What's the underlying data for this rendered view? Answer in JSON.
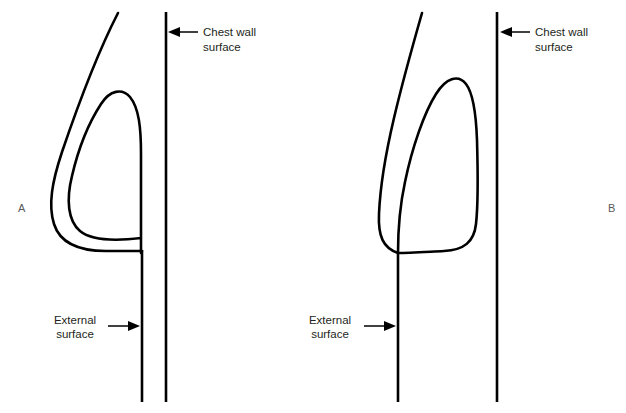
{
  "figure": {
    "background_color": "#ffffff",
    "stroke_color": "#000000",
    "text_color": "#231f20",
    "panel_letter_color": "#5a5a5a"
  },
  "panels": [
    {
      "letter": "A",
      "letter_x": 18,
      "letter_y": 212,
      "chest_wall": {
        "label_line_1": "Chest wall",
        "label_line_2": "surface",
        "label_x": 203,
        "label_y_1": 32,
        "label_y_2": 47,
        "arrow_direction": "left",
        "arrow_tip_x": 170,
        "arrow_tail_x": 198,
        "arrow_y": 32,
        "line_x": 166,
        "line_top_y": 12,
        "line_bottom_y": 402
      },
      "external_surface": {
        "label_line_1": "External",
        "label_line_2": "surface",
        "label_x": 75,
        "label_y_1": 320,
        "label_y_2": 334,
        "arrow_direction": "right",
        "arrow_tail_x": 108,
        "arrow_tip_x": 140,
        "arrow_y": 326,
        "line_x": 142,
        "line_top_y": 250,
        "line_bottom_y": 402
      }
    },
    {
      "letter": "B",
      "letter_x": 608,
      "letter_y": 212,
      "chest_wall": {
        "label_line_1": "Chest wall",
        "label_line_2": "surface",
        "label_x": 535,
        "label_y_1": 32,
        "label_y_2": 47,
        "arrow_direction": "left",
        "arrow_tip_x": 501,
        "arrow_tail_x": 530,
        "arrow_y": 32,
        "line_x": 497,
        "line_top_y": 12,
        "line_bottom_y": 402
      },
      "external_surface": {
        "label_line_1": "External",
        "label_line_2": "surface",
        "label_x": 330,
        "label_y_1": 320,
        "label_y_2": 334,
        "arrow_direction": "right",
        "arrow_tail_x": 364,
        "arrow_tip_x": 396,
        "arrow_y": 326,
        "line_x": 398,
        "line_top_y": 252,
        "line_bottom_y": 402
      }
    }
  ],
  "outlines": {
    "panel_a_skin": "M 118 13 C 100 48 78 105 62 152 C 52 182 48 205 54 224 C 60 243 80 251 106 251 L 142 251",
    "panel_a_parenchyma": "M 141 253 C 141 230 141 190 141 154 C 141 128 139 108 130 97 C 122 88 110 90 101 104 C 88 124 78 150 72 176 C 66 200 68 221 80 231 C 92 241 116 241 141 238 Z",
    "panel_b_skin": "M 422 13 C 412 48 402 84 394 118 C 386 152 380 190 379 214 C 378 236 383 248 398 253",
    "panel_b_parenchyma": "M 398 253 C 398 232 400 205 405 182 C 412 148 424 113 436 94 C 446 78 458 74 466 84 C 473 93 476 112 477 140 C 478 175 478 206 476 224 C 474 242 464 250 444 251 C 424 252 408 253 398 253 Z"
  }
}
